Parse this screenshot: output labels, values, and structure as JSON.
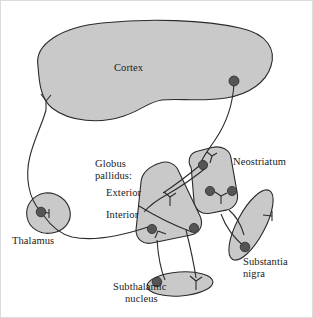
{
  "figure": {
    "width": 313,
    "height": 318,
    "background_color": "#ffffff",
    "stroke_color": "#2b2b2b",
    "region_fill_color": "#c9c9c9",
    "soma_fill_color": "#555555",
    "border_color": "#d8d8d8"
  },
  "labels": {
    "cortex": "Cortex",
    "neostriatum": "Neostriatum",
    "globus_pallidus_line1": "Globus",
    "globus_pallidus_line2": "pallidus:",
    "exterior": "Exterior",
    "interior": "Interior",
    "thalamus": "Thalamus",
    "substantia_nigra_line1": "Substantia",
    "substantia_nigra_line2": "nigra",
    "subthalamic_line1": "Subthalamic",
    "subthalamic_line2": "nucleus"
  },
  "regions": [
    {
      "name": "cortex",
      "label": "Cortex",
      "shape": "kidney-blob",
      "soma_count": 1,
      "dendrite_count": 1
    },
    {
      "name": "neostriatum",
      "label": "Neostriatum",
      "shape": "rounded-rect-tilted",
      "soma_count": 3,
      "dendrite_count": 2
    },
    {
      "name": "globus-pallidus-exterior",
      "label": "Exterior",
      "shape": "rounded-quad-upper",
      "soma_count": 1,
      "dendrite_count": 1
    },
    {
      "name": "globus-pallidus-interior",
      "label": "Interior",
      "shape": "rounded-quad-lower",
      "soma_count": 1,
      "dendrite_count": 1
    },
    {
      "name": "thalamus",
      "label": "Thalamus",
      "shape": "blob",
      "soma_count": 1,
      "dendrite_count": 1
    },
    {
      "name": "substantia-nigra",
      "label": "Substantia nigra",
      "shape": "tilted-ellipse",
      "soma_count": 1,
      "dendrite_count": 1
    },
    {
      "name": "subthalamic-nucleus",
      "label": "Subthalamic nucleus",
      "shape": "horizontal-ellipse",
      "soma_count": 1,
      "dendrite_count": 1
    }
  ],
  "connections": [
    {
      "from": "cortex",
      "to": "neostriatum"
    },
    {
      "from": "thalamus",
      "to": "cortex"
    },
    {
      "from": "neostriatum",
      "to": "globus-pallidus-exterior"
    },
    {
      "from": "neostriatum",
      "to": "substantia-nigra"
    },
    {
      "from": "globus-pallidus-interior",
      "to": "thalamus"
    },
    {
      "from": "globus-pallidus-exterior",
      "to": "subthalamic-nucleus"
    },
    {
      "from": "globus-pallidus-interior",
      "to": "subthalamic-nucleus"
    },
    {
      "from": "substantia-nigra",
      "to": "neostriatum"
    }
  ]
}
